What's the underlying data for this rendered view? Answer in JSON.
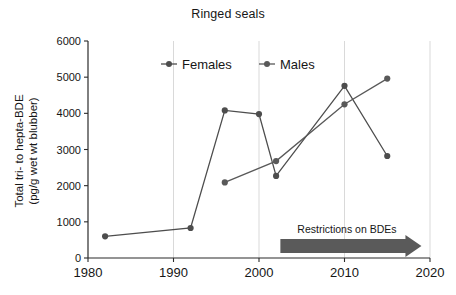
{
  "chart_data": {
    "type": "line",
    "title": "Ringed seals",
    "xlabel": "",
    "ylabel": "Total tri- to hepta-BDE (pg/g wet wt blubber)",
    "ylabel_line1": "Total tri- to hepta-BDE",
    "ylabel_line2": "(pg/g wet wt blubber)",
    "xlim": [
      1980,
      2020
    ],
    "ylim": [
      0,
      6000
    ],
    "xticks": [
      1980,
      1990,
      2000,
      2010,
      2020
    ],
    "xtick_labels": [
      "1980",
      "1990",
      "2000",
      "2010",
      "2020"
    ],
    "yticks": [
      0,
      1000,
      2000,
      3000,
      4000,
      5000,
      6000
    ],
    "ytick_labels": [
      "0",
      "1000",
      "2000",
      "3000",
      "4000",
      "5000",
      "6000"
    ],
    "grid": "vertical-only",
    "legend_position": "top-center-inside",
    "series": [
      {
        "name": "Females",
        "color": "#4d4d4d",
        "marker": "circle",
        "x": [
          1982,
          1992,
          1996,
          2000,
          2002,
          2010,
          2015
        ],
        "values": [
          600,
          830,
          4080,
          3980,
          2270,
          4760,
          2820
        ]
      },
      {
        "name": "Males",
        "color": "#595959",
        "marker": "circle",
        "x": [
          1996,
          2002,
          2010,
          2015
        ],
        "values": [
          2090,
          2680,
          4250,
          4960
        ]
      }
    ],
    "annotations": [
      {
        "name": "restrictions-arrow",
        "text": "Restrictions on BDEs",
        "x_start": 2002.5,
        "x_end": 2019,
        "y": 330,
        "color": "#5a5a5a"
      }
    ]
  },
  "legend": {
    "entries": [
      {
        "label": "Females"
      },
      {
        "label": "Males"
      }
    ]
  }
}
